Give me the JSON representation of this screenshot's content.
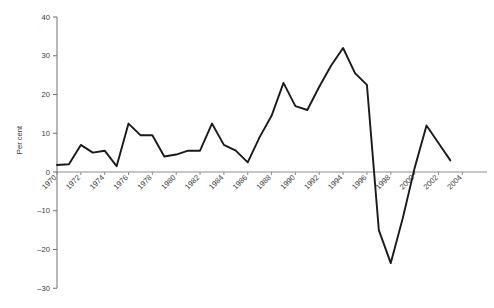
{
  "chart_data": {
    "type": "line",
    "title": "",
    "xlabel": "",
    "ylabel": "Per cent",
    "ylim": [
      -30,
      40
    ],
    "xlim": [
      1970,
      2004
    ],
    "grid": false,
    "legend": null,
    "y_ticks": [
      40,
      30,
      20,
      10,
      0,
      -10,
      -20,
      -30
    ],
    "y_tick_labels": [
      "40",
      "30",
      "20",
      "10",
      "0",
      "–10",
      "–20",
      "–30"
    ],
    "x_ticks": [
      1970,
      1972,
      1974,
      1976,
      1978,
      1980,
      1982,
      1984,
      1986,
      1988,
      1990,
      1992,
      1994,
      1996,
      1998,
      2000,
      2002,
      2004
    ],
    "x_tick_labels": [
      "1970",
      "1972",
      "1974",
      "1976",
      "1978",
      "1980",
      "1982",
      "1984",
      "1986",
      "1988",
      "1990",
      "1992",
      "1994",
      "1996",
      "1998",
      "2000",
      "2002",
      "2004"
    ],
    "series": [
      {
        "name": "Per cent",
        "color": "#1a1a1a",
        "x": [
          1970,
          1971,
          1972,
          1973,
          1974,
          1975,
          1976,
          1977,
          1978,
          1979,
          1980,
          1981,
          1982,
          1983,
          1984,
          1985,
          1986,
          1987,
          1988,
          1989,
          1990,
          1991,
          1992,
          1993,
          1994,
          1995,
          1996,
          1997,
          1998,
          1999,
          2000,
          2001,
          2002,
          2003
        ],
        "y": [
          1.8,
          2.0,
          7.0,
          5.0,
          5.5,
          1.5,
          12.5,
          9.5,
          9.5,
          4.0,
          4.5,
          5.5,
          5.5,
          12.5,
          7.0,
          5.5,
          2.5,
          9.0,
          14.5,
          23.0,
          17.0,
          16.0,
          22.0,
          27.5,
          32.0,
          25.5,
          22.5,
          -15.0,
          -23.5,
          -12.0,
          1.0,
          12.0,
          7.5,
          3.0
        ]
      }
    ]
  },
  "axis": {
    "y_title": "Per cent"
  },
  "source": {
    "text": ""
  }
}
